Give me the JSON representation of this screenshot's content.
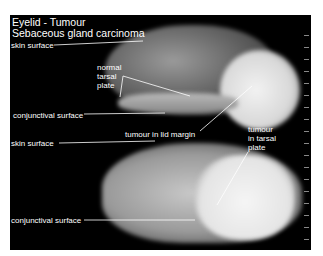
{
  "figure": {
    "title_line1": "Eyelid - Tumour",
    "title_line2": "Sebaceous gland carcinoma",
    "upper_specimen_labels": {
      "skin_surface": "skin surface",
      "normal_tarsal_plate": [
        "normal",
        "tarsal",
        "plate"
      ],
      "conjunctival_surface": "conjunctival surface",
      "tumour_in_lid_margin": "tumour in lid margin"
    },
    "lower_specimen_labels": {
      "skin_surface": "skin surface",
      "tumour_in_tarsal_plate": [
        "tumour",
        "in tarsal",
        "plate"
      ],
      "conjunctival_surface": "conjunctival surface"
    },
    "colors": {
      "background": "#000000",
      "label": "#ffffff",
      "page": "#ffffff"
    }
  }
}
